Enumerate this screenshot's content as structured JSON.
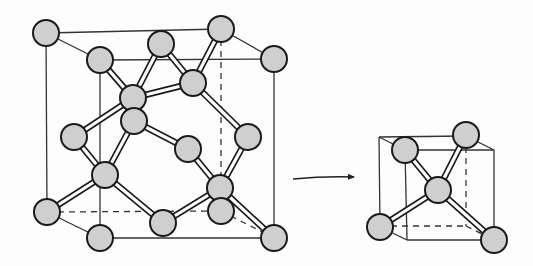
{
  "diagram": {
    "title": "",
    "colors": {
      "background": "#fdfdfd",
      "line": "#333333",
      "atom_fill": "#cfcfcf",
      "atom_stroke": "#1a1a1a",
      "bond_fill": "#ffffff"
    },
    "atom_radius": 13,
    "big_cell": {
      "cube_solid_edges": [
        [
          46,
          33,
          221,
          29
        ],
        [
          46,
          33,
          100,
          60
        ],
        [
          221,
          29,
          274,
          59
        ],
        [
          100,
          60,
          274,
          59
        ],
        [
          46,
          33,
          47,
          212
        ],
        [
          100,
          60,
          100,
          238
        ],
        [
          274,
          59,
          274,
          238
        ],
        [
          100,
          238,
          274,
          238
        ],
        [
          47,
          212,
          100,
          238
        ]
      ],
      "cube_dashed_edges": [
        [
          47,
          212,
          221,
          211
        ],
        [
          221,
          29,
          221,
          211
        ],
        [
          221,
          211,
          274,
          238
        ]
      ],
      "bonds": [
        [
          100,
          60,
          133,
          98
        ],
        [
          161,
          44,
          133,
          98
        ],
        [
          74,
          137,
          133,
          98
        ],
        [
          193,
          83,
          133,
          98
        ],
        [
          161,
          44,
          193,
          83
        ],
        [
          221,
          29,
          193,
          83
        ],
        [
          248,
          137,
          193,
          83
        ],
        [
          133,
          98,
          134,
          121
        ],
        [
          134,
          121,
          105,
          175
        ],
        [
          74,
          137,
          105,
          175
        ],
        [
          47,
          212,
          105,
          175
        ],
        [
          163,
          223,
          105,
          175
        ],
        [
          134,
          121,
          188,
          149
        ],
        [
          188,
          149,
          220,
          188
        ],
        [
          248,
          137,
          220,
          188
        ],
        [
          163,
          223,
          220,
          188
        ],
        [
          274,
          238,
          220,
          188
        ]
      ],
      "atoms": [
        {
          "x": 46,
          "y": 33,
          "role": "corner"
        },
        {
          "x": 221,
          "y": 29,
          "role": "corner"
        },
        {
          "x": 100,
          "y": 60,
          "role": "corner"
        },
        {
          "x": 274,
          "y": 59,
          "role": "corner"
        },
        {
          "x": 161,
          "y": 44,
          "role": "face-center"
        },
        {
          "x": 193,
          "y": 83,
          "role": "interior"
        },
        {
          "x": 133,
          "y": 98,
          "role": "interior"
        },
        {
          "x": 134,
          "y": 121,
          "role": "face-center"
        },
        {
          "x": 74,
          "y": 137,
          "role": "face-center"
        },
        {
          "x": 248,
          "y": 137,
          "role": "face-center"
        },
        {
          "x": 188,
          "y": 149,
          "role": "face-center"
        },
        {
          "x": 105,
          "y": 175,
          "role": "interior"
        },
        {
          "x": 220,
          "y": 188,
          "role": "interior"
        },
        {
          "x": 221,
          "y": 211,
          "role": "corner"
        },
        {
          "x": 47,
          "y": 212,
          "role": "corner"
        },
        {
          "x": 163,
          "y": 223,
          "role": "face-center"
        },
        {
          "x": 100,
          "y": 238,
          "role": "corner"
        },
        {
          "x": 274,
          "y": 238,
          "role": "corner"
        }
      ]
    },
    "arrow": {
      "x1": 293,
      "y1": 179,
      "cx": 325,
      "cy": 176,
      "x2": 354,
      "y2": 177
    },
    "small_cell": {
      "cube_solid_edges": [
        [
          379,
          137,
          466,
          136
        ],
        [
          379,
          137,
          405,
          150
        ],
        [
          466,
          136,
          494,
          150
        ],
        [
          405,
          150,
          494,
          150
        ],
        [
          379,
          137,
          380,
          227
        ],
        [
          405,
          150,
          407,
          240
        ],
        [
          494,
          150,
          494,
          240
        ],
        [
          407,
          240,
          494,
          240
        ],
        [
          380,
          227,
          407,
          240
        ]
      ],
      "cube_dashed_edges": [
        [
          380,
          226,
          466,
          226
        ],
        [
          466,
          136,
          466,
          226
        ],
        [
          466,
          226,
          494,
          240
        ]
      ],
      "bonds": [
        [
          405,
          150,
          438,
          190
        ],
        [
          466,
          135,
          438,
          190
        ],
        [
          380,
          227,
          438,
          190
        ],
        [
          494,
          240,
          438,
          190
        ]
      ],
      "atoms": [
        {
          "x": 405,
          "y": 150,
          "role": "vertex"
        },
        {
          "x": 466,
          "y": 135,
          "role": "vertex"
        },
        {
          "x": 438,
          "y": 190,
          "role": "center"
        },
        {
          "x": 380,
          "y": 227,
          "role": "vertex"
        },
        {
          "x": 494,
          "y": 240,
          "role": "vertex"
        }
      ]
    }
  }
}
